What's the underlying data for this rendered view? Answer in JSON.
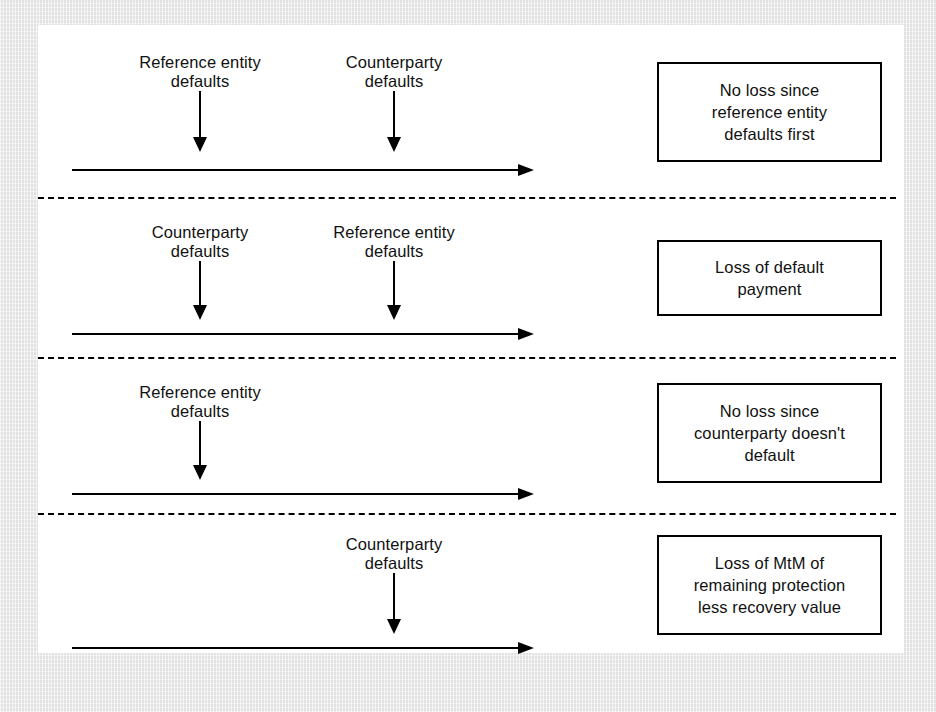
{
  "figure": {
    "panels": [
      {
        "id": "panel-1",
        "events": [
          {
            "name": "reference-entity-default",
            "label": "Reference entity\ndefaults",
            "position_pct": 27
          },
          {
            "name": "counterparty-default",
            "label": "Counterparty\ndefaults",
            "position_pct": 70
          }
        ],
        "outcome": "No loss since\nreference entity\ndefaults first",
        "outcome_lines": 3
      },
      {
        "id": "panel-2",
        "events": [
          {
            "name": "counterparty-default",
            "label": "Counterparty\ndefaults",
            "position_pct": 27
          },
          {
            "name": "reference-entity-default",
            "label": "Reference entity\ndefaults",
            "position_pct": 70
          }
        ],
        "outcome": "Loss of default\npayment",
        "outcome_lines": 2
      },
      {
        "id": "panel-3",
        "events": [
          {
            "name": "reference-entity-default",
            "label": "Reference entity\ndefaults",
            "position_pct": 27
          }
        ],
        "outcome": "No loss since\ncounterparty doesn't\ndefault",
        "outcome_lines": 3
      },
      {
        "id": "panel-4",
        "events": [
          {
            "name": "counterparty-default",
            "label": "Counterparty\ndefaults",
            "position_pct": 70
          }
        ],
        "outcome": "Loss of MtM of\nremaining protection\nless recovery value",
        "outcome_lines": 3
      }
    ],
    "colors": {
      "ink": "#000000",
      "sheet": "#ffffff",
      "scan_margin": "#e9e9e9"
    }
  }
}
